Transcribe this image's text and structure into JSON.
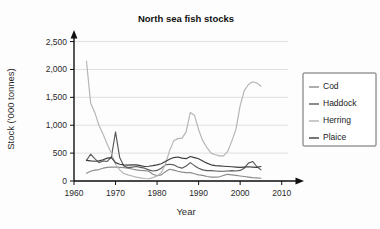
{
  "chart_data": {
    "type": "line",
    "title": "North sea fish stocks",
    "xlabel": "Year",
    "ylabel": "Stock ('000 tonnes)",
    "xlim": [
      1960,
      2012
    ],
    "ylim": [
      0,
      2600
    ],
    "xticks": [
      "1960",
      "1970",
      "1980",
      "1990",
      "2000",
      "2010"
    ],
    "xtick_values": [
      1960,
      1970,
      1980,
      1990,
      2000,
      2010
    ],
    "yticks": [
      "0",
      "500",
      "1,000",
      "1,500",
      "2,000",
      "2,500"
    ],
    "ytick_values": [
      0,
      500,
      1000,
      1500,
      2000,
      2500
    ],
    "grid": "horizontal",
    "legend_position": "right-outside",
    "series": [
      {
        "name": "Cod",
        "color": "#8c8c8c",
        "x": [
          1963,
          1964,
          1965,
          1966,
          1967,
          1968,
          1969,
          1970,
          1971,
          1972,
          1973,
          1974,
          1975,
          1976,
          1977,
          1978,
          1979,
          1980,
          1981,
          1982,
          1983,
          1984,
          1985,
          1986,
          1987,
          1988,
          1989,
          1990,
          1991,
          1992,
          1993,
          1994,
          1995,
          1996,
          1997,
          1998,
          1999,
          2000,
          2001,
          2002,
          2003,
          2004,
          2005
        ],
        "values": [
          140,
          175,
          195,
          205,
          230,
          245,
          250,
          250,
          245,
          240,
          230,
          215,
          200,
          190,
          185,
          175,
          120,
          95,
          110,
          165,
          210,
          195,
          175,
          160,
          150,
          150,
          130,
          110,
          100,
          80,
          70,
          70,
          75,
          100,
          120,
          110,
          100,
          90,
          80,
          70,
          60,
          55,
          50
        ]
      },
      {
        "name": "Haddock",
        "color": "#5a5a5a",
        "x": [
          1963,
          1964,
          1965,
          1966,
          1967,
          1968,
          1969,
          1970,
          1971,
          1972,
          1973,
          1974,
          1975,
          1976,
          1977,
          1978,
          1979,
          1980,
          1981,
          1982,
          1983,
          1984,
          1985,
          1986,
          1987,
          1988,
          1989,
          1990,
          1991,
          1992,
          1993,
          1994,
          1995,
          1996,
          1997,
          1998,
          1999,
          2000,
          2001,
          2002,
          2003,
          2004,
          2005
        ],
        "values": [
          370,
          480,
          400,
          330,
          360,
          350,
          430,
          880,
          420,
          270,
          240,
          250,
          260,
          245,
          230,
          200,
          180,
          190,
          230,
          290,
          300,
          290,
          250,
          230,
          270,
          330,
          275,
          230,
          200,
          185,
          185,
          180,
          175,
          175,
          180,
          185,
          180,
          190,
          230,
          320,
          350,
          260,
          200
        ]
      },
      {
        "name": "Herring",
        "color": "#b4b4b4",
        "x": [
          1963,
          1964,
          1965,
          1966,
          1967,
          1968,
          1969,
          1970,
          1971,
          1972,
          1973,
          1974,
          1975,
          1976,
          1977,
          1978,
          1979,
          1980,
          1981,
          1982,
          1983,
          1984,
          1985,
          1986,
          1987,
          1988,
          1989,
          1990,
          1991,
          1992,
          1993,
          1994,
          1995,
          1996,
          1997,
          1998,
          1999,
          2000,
          2001,
          2002,
          2003,
          2004,
          2005
        ],
        "values": [
          2150,
          1400,
          1230,
          1000,
          840,
          660,
          500,
          300,
          200,
          135,
          110,
          90,
          70,
          55,
          45,
          40,
          60,
          90,
          150,
          300,
          540,
          720,
          760,
          770,
          880,
          1230,
          1180,
          920,
          720,
          600,
          500,
          470,
          450,
          450,
          530,
          720,
          930,
          1350,
          1620,
          1730,
          1780,
          1760,
          1700
        ]
      },
      {
        "name": "Plaice",
        "color": "#3c3c3c",
        "x": [
          1963,
          1964,
          1965,
          1966,
          1967,
          1968,
          1969,
          1970,
          1971,
          1972,
          1973,
          1974,
          1975,
          1976,
          1977,
          1978,
          1979,
          1980,
          1981,
          1982,
          1983,
          1984,
          1985,
          1986,
          1987,
          1988,
          1989,
          1990,
          1991,
          1992,
          1993,
          1994,
          1995,
          1996,
          1997,
          1998,
          1999,
          2000,
          2001,
          2002,
          2003,
          2004,
          2005
        ],
        "values": [
          370,
          360,
          355,
          360,
          380,
          410,
          420,
          330,
          300,
          290,
          285,
          290,
          290,
          275,
          260,
          265,
          275,
          290,
          310,
          350,
          390,
          420,
          430,
          410,
          400,
          440,
          420,
          400,
          360,
          320,
          290,
          275,
          270,
          265,
          260,
          255,
          250,
          245,
          250,
          255,
          250,
          245,
          260
        ]
      }
    ]
  },
  "legend": {
    "items": [
      {
        "label": "Cod"
      },
      {
        "label": "Haddock"
      },
      {
        "label": "Herring"
      },
      {
        "label": "Plaice"
      }
    ]
  }
}
